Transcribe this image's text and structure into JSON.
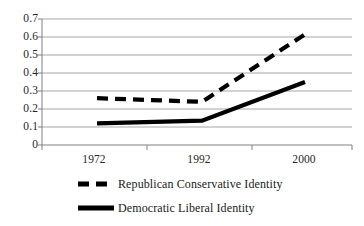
{
  "chart_data": {
    "type": "line",
    "title": "",
    "subtitle": "",
    "xlabel": "",
    "ylabel": "",
    "categories": [
      "1972",
      "1992",
      "2000"
    ],
    "x": [
      1972,
      1992,
      2000
    ],
    "xlim": [
      1972,
      2000
    ],
    "ylim": [
      0,
      0.7
    ],
    "grid": true,
    "grid_axis": "y",
    "legend_position": "bottom-left",
    "y_ticks": [
      "0.7",
      "0.6",
      "0.5",
      "0.4",
      "0.3",
      "0.2",
      "0.1",
      "0"
    ],
    "y_tick_values": [
      0.7,
      0.6,
      0.5,
      0.4,
      0.3,
      0.2,
      0.1,
      0
    ],
    "x_ticks": [
      "1972",
      "1992",
      "2000"
    ],
    "series": [
      {
        "name": "Republican Conservative Identity",
        "style": "dashed",
        "color": "#000000",
        "values": [
          0.26,
          0.24,
          0.615
        ]
      },
      {
        "name": "Democratic Liberal Identity",
        "style": "solid",
        "color": "#000000",
        "values": [
          0.12,
          0.135,
          0.35
        ]
      }
    ]
  },
  "axis": {
    "y_labels": [
      "0.7",
      "0.6",
      "0.5",
      "0.4",
      "0.3",
      "0.2",
      "0.1",
      "0"
    ],
    "x_labels": [
      "1972",
      "1992",
      "2000"
    ]
  },
  "legend": {
    "items": [
      {
        "label": "Republican Conservative Identity",
        "style": "dashed"
      },
      {
        "label": "Democratic Liberal Identity",
        "style": "solid"
      }
    ]
  },
  "colors": {
    "line": "#000000",
    "grid": "#a6a6a6",
    "axis": "#7f7f7f",
    "text": "#262626",
    "background": "#ffffff"
  }
}
